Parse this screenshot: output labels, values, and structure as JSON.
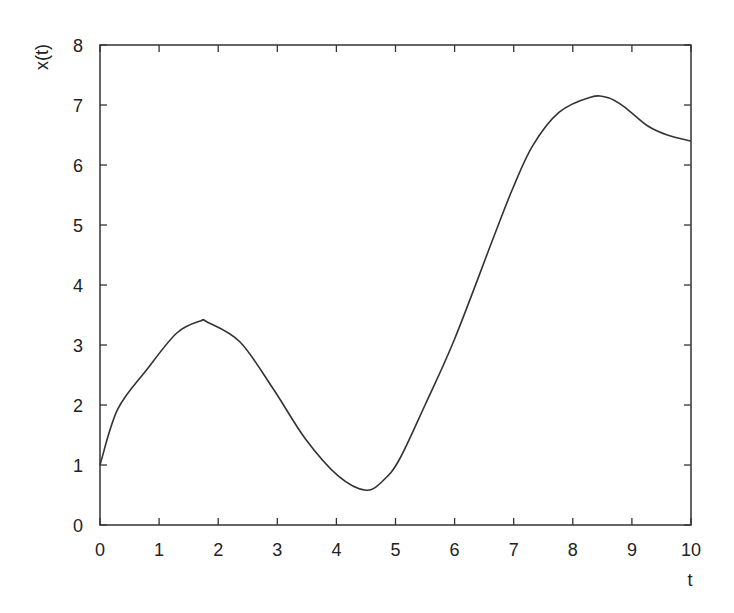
{
  "chart_data": {
    "type": "line",
    "title": "",
    "xlabel": "t",
    "ylabel": "x(t)",
    "xlim": [
      0,
      10
    ],
    "ylim": [
      0,
      8
    ],
    "xticks": [
      0,
      1,
      2,
      3,
      4,
      5,
      6,
      7,
      8,
      9,
      10
    ],
    "yticks": [
      0,
      1,
      2,
      3,
      4,
      5,
      6,
      7,
      8
    ],
    "grid": false,
    "legend": null,
    "series": [
      {
        "name": "x(t)",
        "color": "#333333",
        "x": [
          0,
          0.3,
          0.8,
          1.3,
          1.7,
          1.82,
          2.37,
          2.93,
          3.48,
          4.03,
          4.5,
          4.8,
          5.07,
          5.5,
          6.0,
          6.65,
          6.98,
          7.32,
          7.77,
          8.3,
          8.6,
          8.87,
          9.27,
          9.6,
          10
        ],
        "y": [
          1.0,
          1.93,
          2.6,
          3.2,
          3.4,
          3.38,
          3.05,
          2.27,
          1.43,
          0.82,
          0.58,
          0.75,
          1.1,
          2.0,
          3.1,
          4.77,
          5.6,
          6.32,
          6.88,
          7.13,
          7.12,
          6.97,
          6.65,
          6.5,
          6.4
        ]
      }
    ]
  }
}
